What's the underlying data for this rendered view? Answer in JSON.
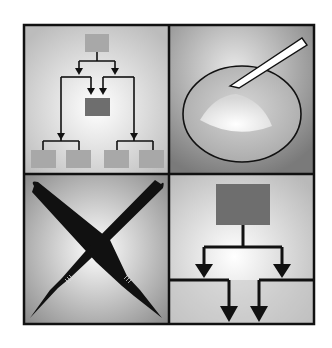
{
  "figure": {
    "panels": [
      {
        "id": "top-left",
        "subject": "organizational flowchart",
        "icon": "flowchart-icon"
      },
      {
        "id": "top-right",
        "subject": "dish with spatula and powder",
        "icon": "dish-icon"
      },
      {
        "id": "bottom-left",
        "subject": "crossed scalpels",
        "icon": "scalpel-icon"
      },
      {
        "id": "bottom-right",
        "subject": "branching flow arrows",
        "icon": "branch-arrows-icon"
      }
    ],
    "colors": {
      "frame": "#111111",
      "box_light": "#a9a9a9",
      "box_dark": "#6e6e6e",
      "panel_light": "#f2f2f2",
      "panel_mid": "#bdbdbd",
      "panel_dark": "#808080"
    }
  }
}
